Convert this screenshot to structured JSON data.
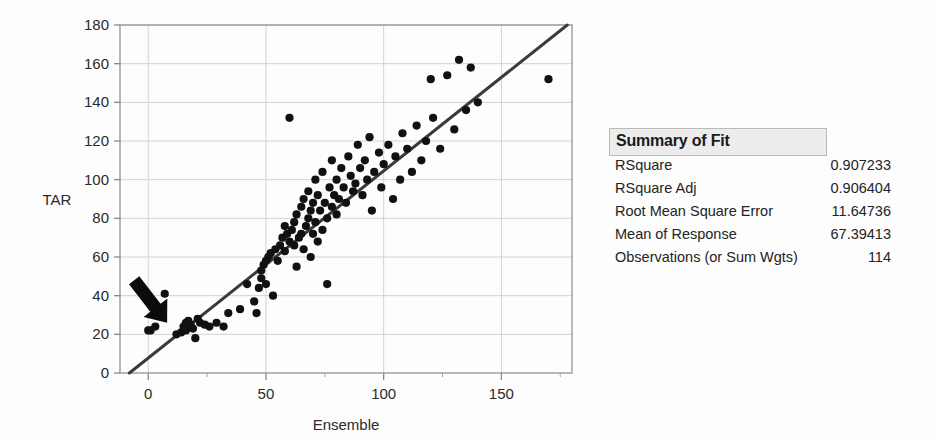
{
  "chart_data": {
    "type": "scatter",
    "title": "",
    "xlabel": "Ensemble",
    "ylabel": "TAR",
    "xlim": [
      -12,
      180
    ],
    "ylim": [
      0,
      180
    ],
    "xticks": [
      0,
      50,
      100,
      150
    ],
    "yticks": [
      0,
      20,
      40,
      60,
      80,
      100,
      120,
      140,
      160,
      180
    ],
    "xminorticks": [
      25,
      75,
      125,
      175
    ],
    "grid": true,
    "legend": null,
    "annotations": [
      {
        "type": "arrow",
        "name": "black-arrow-annotation",
        "points_to_x": 8,
        "points_to_y": 26,
        "tail_x": -6,
        "tail_y": 48
      }
    ],
    "fit_line": {
      "name": "linear-fit-line",
      "x_start": -8,
      "y_start": 0,
      "x_end": 178,
      "y_end": 180,
      "color": "#3a3a3a"
    },
    "marker_color": "#111111",
    "points": [
      {
        "x": 0,
        "y": 22
      },
      {
        "x": 1,
        "y": 22
      },
      {
        "x": 3,
        "y": 24
      },
      {
        "x": 7,
        "y": 41
      },
      {
        "x": 12,
        "y": 20
      },
      {
        "x": 14,
        "y": 21
      },
      {
        "x": 15,
        "y": 24
      },
      {
        "x": 16,
        "y": 22
      },
      {
        "x": 16,
        "y": 26
      },
      {
        "x": 17,
        "y": 27
      },
      {
        "x": 18,
        "y": 25
      },
      {
        "x": 19,
        "y": 23
      },
      {
        "x": 20,
        "y": 18
      },
      {
        "x": 21,
        "y": 28
      },
      {
        "x": 22,
        "y": 26
      },
      {
        "x": 24,
        "y": 25
      },
      {
        "x": 26,
        "y": 24
      },
      {
        "x": 29,
        "y": 26
      },
      {
        "x": 32,
        "y": 24
      },
      {
        "x": 34,
        "y": 31
      },
      {
        "x": 39,
        "y": 33
      },
      {
        "x": 42,
        "y": 46
      },
      {
        "x": 45,
        "y": 37
      },
      {
        "x": 46,
        "y": 31
      },
      {
        "x": 47,
        "y": 44
      },
      {
        "x": 48,
        "y": 49
      },
      {
        "x": 48,
        "y": 53
      },
      {
        "x": 49,
        "y": 56
      },
      {
        "x": 50,
        "y": 58
      },
      {
        "x": 50,
        "y": 46
      },
      {
        "x": 51,
        "y": 60
      },
      {
        "x": 52,
        "y": 62
      },
      {
        "x": 53,
        "y": 40
      },
      {
        "x": 54,
        "y": 64
      },
      {
        "x": 55,
        "y": 58
      },
      {
        "x": 56,
        "y": 66
      },
      {
        "x": 57,
        "y": 70
      },
      {
        "x": 58,
        "y": 63
      },
      {
        "x": 58,
        "y": 76
      },
      {
        "x": 59,
        "y": 72
      },
      {
        "x": 60,
        "y": 68
      },
      {
        "x": 60,
        "y": 132
      },
      {
        "x": 61,
        "y": 74
      },
      {
        "x": 62,
        "y": 78
      },
      {
        "x": 62,
        "y": 66
      },
      {
        "x": 63,
        "y": 82
      },
      {
        "x": 63,
        "y": 55
      },
      {
        "x": 64,
        "y": 70
      },
      {
        "x": 65,
        "y": 86
      },
      {
        "x": 65,
        "y": 72
      },
      {
        "x": 66,
        "y": 90
      },
      {
        "x": 66,
        "y": 64
      },
      {
        "x": 67,
        "y": 76
      },
      {
        "x": 68,
        "y": 80
      },
      {
        "x": 68,
        "y": 94
      },
      {
        "x": 69,
        "y": 84
      },
      {
        "x": 69,
        "y": 60
      },
      {
        "x": 70,
        "y": 88
      },
      {
        "x": 70,
        "y": 72
      },
      {
        "x": 71,
        "y": 78
      },
      {
        "x": 71,
        "y": 100
      },
      {
        "x": 72,
        "y": 68
      },
      {
        "x": 72,
        "y": 92
      },
      {
        "x": 73,
        "y": 84
      },
      {
        "x": 74,
        "y": 74
      },
      {
        "x": 74,
        "y": 104
      },
      {
        "x": 75,
        "y": 88
      },
      {
        "x": 76,
        "y": 80
      },
      {
        "x": 76,
        "y": 46
      },
      {
        "x": 77,
        "y": 96
      },
      {
        "x": 78,
        "y": 86
      },
      {
        "x": 78,
        "y": 110
      },
      {
        "x": 79,
        "y": 92
      },
      {
        "x": 80,
        "y": 82
      },
      {
        "x": 80,
        "y": 100
      },
      {
        "x": 81,
        "y": 90
      },
      {
        "x": 82,
        "y": 106
      },
      {
        "x": 83,
        "y": 96
      },
      {
        "x": 84,
        "y": 88
      },
      {
        "x": 85,
        "y": 112
      },
      {
        "x": 86,
        "y": 102
      },
      {
        "x": 87,
        "y": 94
      },
      {
        "x": 88,
        "y": 98
      },
      {
        "x": 89,
        "y": 118
      },
      {
        "x": 90,
        "y": 106
      },
      {
        "x": 91,
        "y": 92
      },
      {
        "x": 92,
        "y": 110
      },
      {
        "x": 93,
        "y": 100
      },
      {
        "x": 94,
        "y": 122
      },
      {
        "x": 95,
        "y": 84
      },
      {
        "x": 96,
        "y": 104
      },
      {
        "x": 98,
        "y": 114
      },
      {
        "x": 99,
        "y": 96
      },
      {
        "x": 100,
        "y": 108
      },
      {
        "x": 102,
        "y": 118
      },
      {
        "x": 104,
        "y": 90
      },
      {
        "x": 105,
        "y": 112
      },
      {
        "x": 107,
        "y": 100
      },
      {
        "x": 108,
        "y": 124
      },
      {
        "x": 110,
        "y": 116
      },
      {
        "x": 112,
        "y": 104
      },
      {
        "x": 114,
        "y": 128
      },
      {
        "x": 116,
        "y": 110
      },
      {
        "x": 118,
        "y": 120
      },
      {
        "x": 120,
        "y": 152
      },
      {
        "x": 121,
        "y": 132
      },
      {
        "x": 124,
        "y": 116
      },
      {
        "x": 127,
        "y": 154
      },
      {
        "x": 130,
        "y": 126
      },
      {
        "x": 132,
        "y": 162
      },
      {
        "x": 135,
        "y": 136
      },
      {
        "x": 137,
        "y": 158
      },
      {
        "x": 140,
        "y": 140
      },
      {
        "x": 170,
        "y": 152
      }
    ]
  },
  "summary_of_fit": {
    "title": "Summary of Fit",
    "rows": [
      {
        "label": "RSquare",
        "value": "0.907233"
      },
      {
        "label": "RSquare Adj",
        "value": "0.906404"
      },
      {
        "label": "Root Mean Square Error",
        "value": "11.64736"
      },
      {
        "label": "Mean of Response",
        "value": "67.39413"
      },
      {
        "label": "Observations (or Sum Wgts)",
        "value": "114"
      }
    ]
  }
}
